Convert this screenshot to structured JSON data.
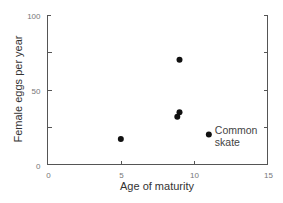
{
  "chart_data": {
    "type": "scatter",
    "title": "",
    "xlabel": "Age of maturity",
    "ylabel": "Female eggs per year",
    "xlim": [
      0,
      15
    ],
    "ylim": [
      0,
      100
    ],
    "x_ticks": [
      0,
      5,
      10,
      15
    ],
    "x_tick_labels": [
      "0",
      "5",
      "10",
      "15"
    ],
    "y_ticks": [
      0,
      25,
      50,
      75,
      100
    ],
    "y_tick_labels": [
      "0",
      "",
      "50",
      "",
      "100"
    ],
    "grid": false,
    "legend": null,
    "points": [
      {
        "x": 5.0,
        "y": 17
      },
      {
        "x": 9.0,
        "y": 70
      },
      {
        "x": 9.0,
        "y": 35
      },
      {
        "x": 8.85,
        "y": 32
      },
      {
        "x": 11.0,
        "y": 20,
        "label": "Common skate"
      }
    ],
    "annotations": [
      {
        "text_line1": "Common",
        "text_line2": "skate",
        "x": 11.0,
        "y": 20
      }
    ]
  }
}
